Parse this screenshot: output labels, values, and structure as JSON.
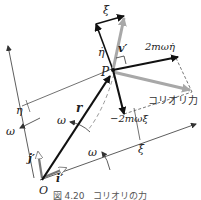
{
  "figure": {
    "caption": "図 4.20　コリオリの力",
    "labels": {
      "xi_dot": "ξ̇",
      "eta_dot": "η̇",
      "v_prime": "v′",
      "force_eta": "2mωη̇",
      "coriolis": "コリオリ力",
      "point_p": "P",
      "force_xi": "−2mωξ̇",
      "r": "r",
      "eta_axis": "η",
      "xi_axis": "ξ",
      "omega_left": "ω",
      "omega_mid": "ω",
      "omega_right": "ω",
      "j_prime": "j′",
      "i_prime": "i′",
      "origin": "O"
    },
    "colors": {
      "black_vector": "#111111",
      "gray_vector": "#a8a8a8",
      "line": "#333333",
      "dashed": "#555555"
    }
  }
}
